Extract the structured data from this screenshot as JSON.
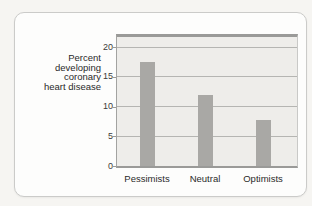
{
  "colors": {
    "page_bg": "#f6f5f2",
    "card_bg": "#fdfdfc",
    "card_border": "#cbcbc9",
    "plot_bg": "#eeedea",
    "grid": "#b5b5b2",
    "axis": "#9a9a98",
    "bar": "#a9a8a5",
    "text": "#2a2a2a"
  },
  "chart_data": {
    "type": "bar",
    "title": "",
    "ylabel": "Percent developing coronary heart disease",
    "ylabel_lines": [
      "Percent",
      "developing",
      "coronary",
      "heart disease"
    ],
    "categories": [
      "Pessimists",
      "Neutral",
      "Optimists"
    ],
    "values": [
      17.5,
      11.9,
      7.8
    ],
    "yticks": [
      0,
      5,
      10,
      15,
      20
    ],
    "ylim": [
      0,
      21.7
    ],
    "grid": true,
    "legend": false
  }
}
